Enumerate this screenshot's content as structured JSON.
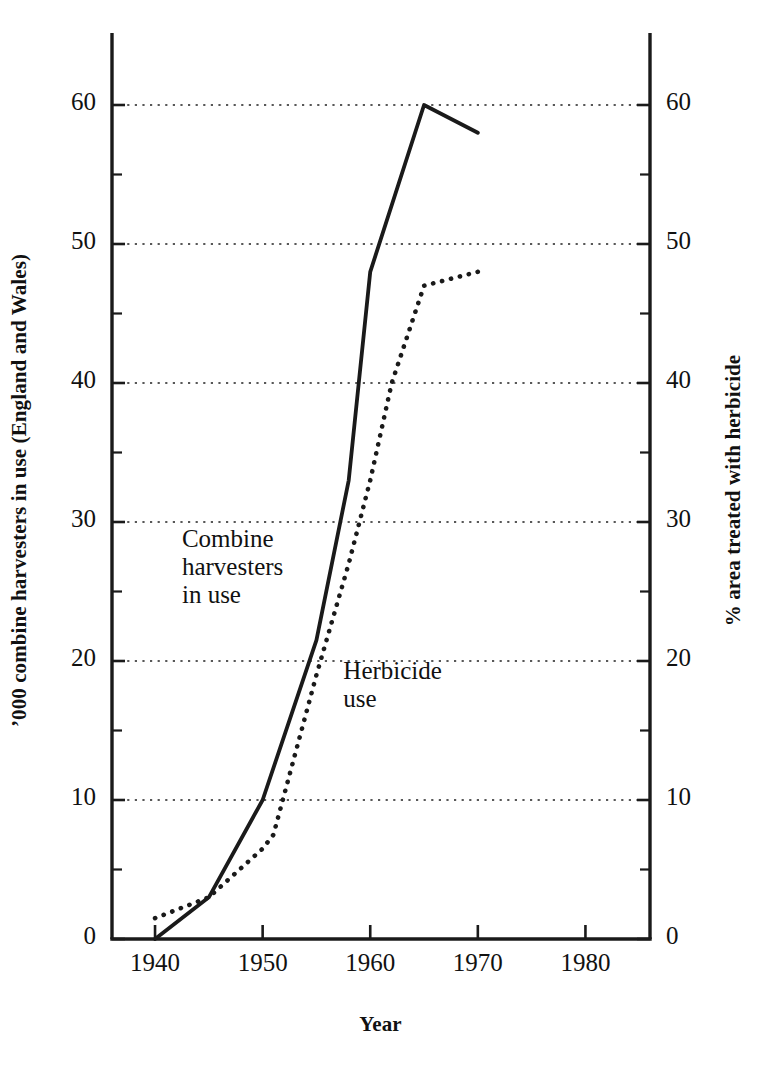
{
  "chart_data": {
    "type": "line",
    "title": "",
    "xlabel": "Year",
    "ylabel": "’000 combine harvesters in use (England and Wales)",
    "y2label": "% area treated with herbicide",
    "xlim": [
      1936,
      1986
    ],
    "ylim": [
      0,
      65
    ],
    "y2lim": [
      0,
      65
    ],
    "xticks": [
      1940,
      1950,
      1960,
      1970,
      1980
    ],
    "xticklabels": [
      "1940",
      "1950",
      "1960",
      "1970",
      "1980"
    ],
    "yticks": [
      0,
      10,
      20,
      30,
      40,
      50,
      60
    ],
    "yticklabels": [
      "0",
      "10",
      "20",
      "30",
      "40",
      "50",
      "60"
    ],
    "y2ticks": [
      0,
      10,
      20,
      30,
      40,
      50,
      60
    ],
    "y2ticklabels": [
      "0",
      "10",
      "20",
      "30",
      "40",
      "50",
      "60"
    ],
    "minor_yticks": [
      5,
      15,
      25,
      35,
      45,
      55
    ],
    "grid": "horizontal-dotted",
    "legend": "inline-annotations",
    "series": [
      {
        "name": "Combine harvesters in use",
        "axis": "left",
        "style": "solid",
        "color": "#1a1a1a",
        "x": [
          1940,
          1945,
          1950,
          1955,
          1958,
          1960,
          1965,
          1970
        ],
        "values": [
          0,
          3,
          10,
          21.5,
          33,
          48,
          60,
          58
        ]
      },
      {
        "name": "Herbicide use",
        "axis": "right",
        "style": "dotted",
        "color": "#1a1a1a",
        "x": [
          1940,
          1945,
          1950,
          1951,
          1955,
          1958,
          1960,
          1962,
          1965,
          1970
        ],
        "values": [
          1.5,
          3,
          6.5,
          7.5,
          19,
          27,
          33,
          40,
          47,
          48
        ]
      }
    ],
    "annotations": [
      {
        "name": "combine-harvesters-label",
        "text": "Combine\nharvesters\nin use",
        "x": 1942.5,
        "y": 28.5
      },
      {
        "name": "herbicide-use-label",
        "text": "Herbicide\nuse",
        "x": 1957.5,
        "y": 19
      }
    ]
  },
  "axis_titles": {
    "left": "’000 combine harvesters in use (England and Wales)",
    "right": "% area treated with herbicide",
    "bottom": "Year"
  },
  "colors": {
    "ink": "#1a1a1a",
    "grid": "#222222",
    "background": "#ffffff"
  }
}
